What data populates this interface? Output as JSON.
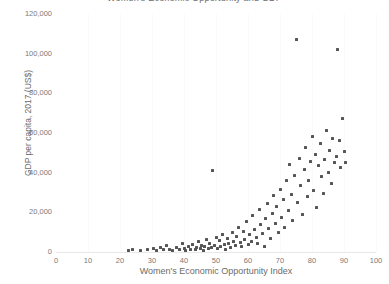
{
  "chart_data": {
    "type": "scatter",
    "title": "Women's Economic Opportunity and GDP",
    "xlabel": "Women's Economic Opportunity Index",
    "ylabel": "GDP per capita, 2017 (US$)",
    "xlim": [
      0,
      100
    ],
    "ylim": [
      0,
      120000
    ],
    "xticks": [
      0,
      10,
      20,
      30,
      40,
      50,
      60,
      70,
      80,
      90,
      100
    ],
    "yticks": [
      0,
      20000,
      40000,
      60000,
      80000,
      100000,
      120000
    ],
    "ytick_labels": [
      "0",
      "20,000",
      "40,000",
      "60,000",
      "80,000",
      "100,000",
      "120,000"
    ],
    "xtick_labels": [
      "0",
      "10",
      "20",
      "30",
      "40",
      "50",
      "60",
      "70",
      "80",
      "90",
      "100"
    ],
    "grid": "vertical-faint",
    "legend": "none",
    "marker_color": "#555555",
    "background": "#ffffff",
    "points": [
      [
        22.5,
        900
      ],
      [
        24.0,
        1400
      ],
      [
        26.5,
        700
      ],
      [
        28.5,
        1100
      ],
      [
        30.5,
        1800
      ],
      [
        31.5,
        900
      ],
      [
        32.5,
        2500
      ],
      [
        33.5,
        1200
      ],
      [
        34.5,
        3200
      ],
      [
        35.5,
        1500
      ],
      [
        36.5,
        900
      ],
      [
        37.5,
        2100
      ],
      [
        38.5,
        1300
      ],
      [
        39.5,
        4200
      ],
      [
        40.0,
        1800
      ],
      [
        40.5,
        900
      ],
      [
        41.5,
        2600
      ],
      [
        42.0,
        1500
      ],
      [
        42.5,
        3800
      ],
      [
        43.5,
        1100
      ],
      [
        44.0,
        2200
      ],
      [
        44.5,
        5200
      ],
      [
        45.0,
        1600
      ],
      [
        45.5,
        3400
      ],
      [
        46.0,
        900
      ],
      [
        46.5,
        2800
      ],
      [
        47.0,
        6200
      ],
      [
        47.5,
        1900
      ],
      [
        48.0,
        4100
      ],
      [
        48.5,
        2400
      ],
      [
        49.0,
        41000
      ],
      [
        49.5,
        3100
      ],
      [
        50.0,
        7400
      ],
      [
        50.5,
        1700
      ],
      [
        51.0,
        5600
      ],
      [
        51.5,
        2900
      ],
      [
        52.0,
        8600
      ],
      [
        52.5,
        3700
      ],
      [
        53.0,
        1400
      ],
      [
        53.5,
        6800
      ],
      [
        54.0,
        4400
      ],
      [
        54.5,
        2200
      ],
      [
        55.0,
        9800
      ],
      [
        55.5,
        5100
      ],
      [
        56.0,
        3300
      ],
      [
        56.5,
        7600
      ],
      [
        57.0,
        12500
      ],
      [
        57.5,
        4800
      ],
      [
        58.0,
        2600
      ],
      [
        58.5,
        10400
      ],
      [
        59.0,
        6300
      ],
      [
        59.5,
        15200
      ],
      [
        60.0,
        3900
      ],
      [
        60.5,
        8900
      ],
      [
        61.0,
        5400
      ],
      [
        61.5,
        18600
      ],
      [
        62.0,
        11200
      ],
      [
        62.5,
        7100
      ],
      [
        63.0,
        4300
      ],
      [
        63.5,
        21400
      ],
      [
        64.0,
        13800
      ],
      [
        64.5,
        9200
      ],
      [
        65.0,
        2800
      ],
      [
        65.5,
        16800
      ],
      [
        66.0,
        24500
      ],
      [
        66.5,
        11900
      ],
      [
        67.0,
        6700
      ],
      [
        67.5,
        19300
      ],
      [
        68.0,
        28400
      ],
      [
        68.5,
        14600
      ],
      [
        69.0,
        22800
      ],
      [
        69.5,
        9600
      ],
      [
        70.0,
        31600
      ],
      [
        70.5,
        17200
      ],
      [
        71.0,
        26300
      ],
      [
        71.5,
        12400
      ],
      [
        72.0,
        35800
      ],
      [
        72.5,
        20700
      ],
      [
        73.0,
        44200
      ],
      [
        73.5,
        29100
      ],
      [
        74.0,
        15800
      ],
      [
        74.5,
        38600
      ],
      [
        75.0,
        107000
      ],
      [
        75.5,
        24900
      ],
      [
        76.0,
        47300
      ],
      [
        76.5,
        33400
      ],
      [
        77.0,
        18900
      ],
      [
        77.5,
        41700
      ],
      [
        78.0,
        52600
      ],
      [
        78.5,
        27800
      ],
      [
        79.0,
        36200
      ],
      [
        79.5,
        45800
      ],
      [
        80.0,
        58400
      ],
      [
        80.5,
        31200
      ],
      [
        81.0,
        49100
      ],
      [
        81.5,
        22600
      ],
      [
        82.0,
        43500
      ],
      [
        82.5,
        54800
      ],
      [
        83.0,
        37900
      ],
      [
        83.5,
        29400
      ],
      [
        84.0,
        46700
      ],
      [
        84.5,
        61200
      ],
      [
        85.0,
        40300
      ],
      [
        85.5,
        51400
      ],
      [
        86.0,
        34600
      ],
      [
        86.5,
        57300
      ],
      [
        87.0,
        44900
      ],
      [
        87.5,
        48200
      ],
      [
        88.0,
        102000
      ],
      [
        88.5,
        56100
      ],
      [
        89.0,
        42800
      ],
      [
        89.5,
        67300
      ],
      [
        90.0,
        50600
      ],
      [
        90.5,
        45200
      ]
    ]
  }
}
